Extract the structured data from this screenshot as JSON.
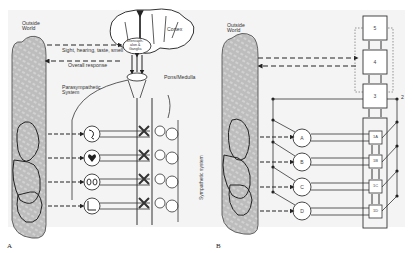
{
  "panel_a": {
    "letter": "A",
    "outside_world": "Outside\nWorld",
    "outside_world_line1": "Outside",
    "outside_world_line2": "World",
    "cortex": "Cortex",
    "diencephalon_line1": "Diencaph-",
    "diencephalon_line2": "alon &",
    "diencephalon_line3": "Ganglia",
    "senses_label": "Sight, hearing, taste, smell",
    "overall_response": "Overall response",
    "pons_medulla": "Pons/Medulla",
    "parasympathetic_line1": "Parasympathetic",
    "parasympathetic_line2": "System",
    "sympathetic_system": "Sympathetic system",
    "organs": [
      "stomach/gut",
      "heart",
      "kidneys",
      "bladder"
    ]
  },
  "panel_b": {
    "letter": "B",
    "outside_world_line1": "Outside",
    "outside_world_line2": "World",
    "levels": [
      "5",
      "4",
      "3"
    ],
    "side_label": "2",
    "circles": [
      "A",
      "B",
      "C",
      "D"
    ],
    "subunits": [
      "1A",
      "1B",
      "1C",
      "1D"
    ]
  },
  "colors": {
    "line": "#333333",
    "hatch_fill": "#b9b9b9",
    "background": "#f4f4f4"
  }
}
